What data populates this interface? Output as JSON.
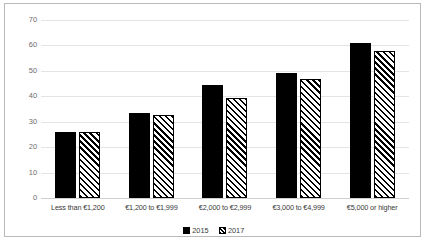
{
  "chart_data": {
    "type": "bar",
    "title": "",
    "subtitle": "",
    "xlabel": "",
    "ylabel": "",
    "ylim": [
      0,
      70
    ],
    "yticks": [
      0,
      10,
      20,
      30,
      40,
      50,
      60,
      70
    ],
    "grid": true,
    "legend_position": "bottom",
    "categories": [
      "Less than €1,200",
      "€1,200 to €1,999",
      "€2,000 to €2,999",
      "€3,000 to €4,999",
      "€5,000 or higher"
    ],
    "series": [
      {
        "name": "2015",
        "fill": "solid",
        "color": "#000000",
        "values": [
          26,
          33.5,
          44.5,
          49,
          61
        ]
      },
      {
        "name": "2017",
        "fill": "diagonal-hatch",
        "color": "#000000",
        "values": [
          26,
          32.5,
          39.5,
          47,
          58
        ]
      }
    ]
  },
  "legend": {
    "items": [
      {
        "label": "2015",
        "swatch": "solid-black-swatch"
      },
      {
        "label": "2017",
        "swatch": "hatched-swatch"
      }
    ]
  },
  "colors": {
    "bar_2015": "#000000",
    "bar_2017_outline": "#000000",
    "gridline": "#e4e4e4",
    "border": "#b9b9b9",
    "tick_text": "#6d6d6d",
    "label_text": "#3a3a3a",
    "background": "#ffffff"
  }
}
